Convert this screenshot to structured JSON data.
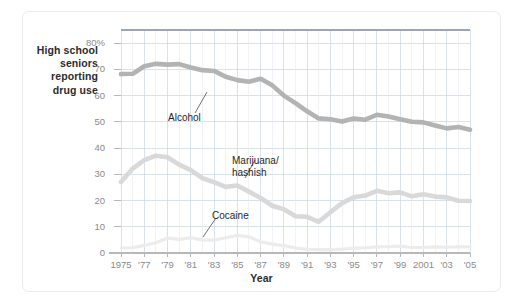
{
  "figure": {
    "background": "#ffffff",
    "frame_color": "#eceaea"
  },
  "axis_titles": {
    "y": "High school\nseniors\nreporting\ndrug use",
    "x": "Year"
  },
  "series_labels": {
    "alcohol": "Alcohol",
    "marijuana": "Marijuana/\nhashish",
    "cocaine": "Cocaine"
  },
  "chart_data": {
    "type": "line",
    "title": "",
    "xlabel": "Year",
    "ylabel": "High school seniors reporting drug use",
    "xlim": [
      1975,
      2005
    ],
    "ylim": [
      0,
      85
    ],
    "yticks": [
      0,
      10,
      20,
      30,
      40,
      50,
      60,
      70,
      80
    ],
    "ytick_labels": [
      "0",
      "10",
      "20",
      "30",
      "40",
      "50",
      "60",
      "70",
      "80%"
    ],
    "xticks": [
      1975,
      1977,
      1979,
      1981,
      1983,
      1985,
      1987,
      1989,
      1991,
      1993,
      1995,
      1997,
      1999,
      2001,
      2003,
      2005
    ],
    "xtick_labels": [
      "1975",
      "'77",
      "'79",
      "'81",
      "'83",
      "'85",
      "'87",
      "'89",
      "'91",
      "'93",
      "'95",
      "'97",
      "'99",
      "2001",
      "'03",
      "'05"
    ],
    "grid": true,
    "grid_color": "#c9d4df",
    "legend": "inline-annotations",
    "x": [
      1975,
      1976,
      1977,
      1978,
      1979,
      1980,
      1981,
      1982,
      1983,
      1984,
      1985,
      1986,
      1987,
      1988,
      1989,
      1990,
      1991,
      1992,
      1993,
      1994,
      1995,
      1996,
      1997,
      1998,
      1999,
      2000,
      2001,
      2002,
      2003,
      2004,
      2005
    ],
    "series": [
      {
        "name": "Alcohol",
        "color": "#b3b3b3",
        "values": [
          68.2,
          68.3,
          71.2,
          72.1,
          71.8,
          72.0,
          70.7,
          69.7,
          69.4,
          67.2,
          65.9,
          65.3,
          66.4,
          63.9,
          60.0,
          57.1,
          54.0,
          51.3,
          51.0,
          50.1,
          51.3,
          50.8,
          52.7,
          52.0,
          51.0,
          50.0,
          49.8,
          48.6,
          47.5,
          48.0,
          47.0
        ]
      },
      {
        "name": "Marijuana/hashish",
        "color": "#d9d9d9",
        "values": [
          27.1,
          32.2,
          35.4,
          37.1,
          36.5,
          33.7,
          31.6,
          28.5,
          27.0,
          25.2,
          25.7,
          23.4,
          21.0,
          18.0,
          16.7,
          14.0,
          13.8,
          11.9,
          15.5,
          19.0,
          21.2,
          21.9,
          23.7,
          22.8,
          23.1,
          21.6,
          22.4,
          21.5,
          21.2,
          19.9,
          19.8
        ]
      },
      {
        "name": "Cocaine",
        "color": "#ececec",
        "values": [
          1.9,
          2.0,
          2.9,
          3.9,
          5.7,
          5.2,
          5.8,
          5.0,
          4.9,
          5.8,
          6.7,
          6.2,
          4.3,
          3.4,
          2.8,
          1.9,
          1.4,
          1.3,
          1.3,
          1.5,
          1.8,
          2.0,
          2.3,
          2.4,
          2.6,
          2.1,
          2.1,
          2.3,
          2.2,
          2.3,
          2.3
        ]
      }
    ]
  },
  "plot_geometry": {
    "left": 121,
    "right": 470,
    "top": 30,
    "bottom": 253
  }
}
